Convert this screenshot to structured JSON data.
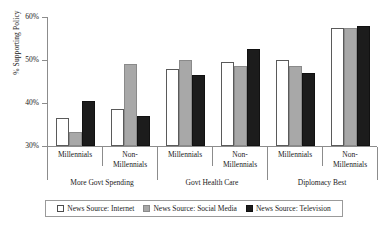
{
  "chart_data": {
    "type": "bar",
    "title": "",
    "xlabel": "",
    "ylabel": "% Supporting Policy",
    "ylim": [
      30,
      60
    ],
    "yticks": [
      "30%",
      "40%",
      "50%",
      "60%"
    ],
    "ytick_values": [
      30,
      40,
      50,
      60
    ],
    "grid": false,
    "legend_position": "bottom",
    "groups": [
      "More Govt Spending",
      "Govt Health Care",
      "Diplomacy Best"
    ],
    "subgroups": [
      "Millennials",
      "Non-Millennials"
    ],
    "categories": [
      "More Govt Spending / Millennials",
      "More Govt Spending / Non-Millennials",
      "Govt Health Care / Millennials",
      "Govt Health Care / Non-Millennials",
      "Diplomacy Best / Millennials",
      "Diplomacy Best / Non-Millennials"
    ],
    "series": [
      {
        "name": "News Source: Internet",
        "color": "#ffffff",
        "values": [
          36.5,
          38.5,
          48.0,
          49.5,
          50.0,
          57.5
        ]
      },
      {
        "name": "News Source: Social Media",
        "color": "#a8a8a8",
        "values": [
          33.3,
          49.0,
          50.0,
          48.5,
          48.5,
          57.5
        ]
      },
      {
        "name": "News Source: Television",
        "color": "#1c1c1c",
        "values": [
          40.5,
          37.0,
          46.5,
          52.5,
          47.0,
          58.0
        ]
      }
    ]
  },
  "axis": {
    "ylabel": "% Supporting Policy",
    "ticks": [
      {
        "label": "60%",
        "value": 60
      },
      {
        "label": "50%",
        "value": 50
      },
      {
        "label": "40%",
        "value": 40
      },
      {
        "label": "30%",
        "value": 30
      }
    ]
  },
  "demographics": [
    {
      "line1": "Millennials",
      "line2": ""
    },
    {
      "line1": "Non-",
      "line2": "Millennials"
    },
    {
      "line1": "Millennials",
      "line2": ""
    },
    {
      "line1": "Non-",
      "line2": "Millennials"
    },
    {
      "line1": "Millennials",
      "line2": ""
    },
    {
      "line1": "Non-",
      "line2": "Millennials"
    }
  ],
  "topics": [
    {
      "label": "More Govt Spending"
    },
    {
      "label": "Govt Health Care"
    },
    {
      "label": "Diplomacy Best"
    }
  ],
  "legend": {
    "items": [
      {
        "label": "News Source: Internet",
        "swatch": "internet"
      },
      {
        "label": "News Source: Social Media",
        "swatch": "social"
      },
      {
        "label": "News Source: Television",
        "swatch": "tv"
      }
    ]
  }
}
